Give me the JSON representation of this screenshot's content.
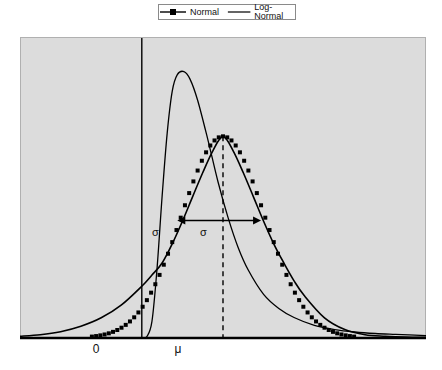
{
  "legend": {
    "position": "top-center",
    "entries": [
      {
        "label": "Normal",
        "marker": "square",
        "style": "line-with-markers",
        "color": "#000000"
      },
      {
        "label": "Log-Normal",
        "marker": "none",
        "style": "line",
        "color": "#000000"
      }
    ]
  },
  "axes": {
    "x_tick_labels": [
      "0",
      "μ"
    ],
    "x_tick_positions": [
      96,
      178
    ],
    "y_tick_labels": [],
    "grid": false,
    "plot_background": "#dcdcdc",
    "axis_color": "#000000"
  },
  "annotations": {
    "sigma_left_label": "σ",
    "sigma_right_label": "σ",
    "zero_line_label": "0",
    "mean_line_label": "μ"
  },
  "chart_data": {
    "type": "line",
    "title": "",
    "xlabel": "",
    "ylabel": "",
    "grid": false,
    "legend_position": "top-center",
    "xlim": [
      -2.4,
      5.6
    ],
    "ylim": [
      0,
      1.0
    ],
    "x_ticks": [
      0,
      1.6
    ],
    "x_tick_labels": [
      "0",
      "μ"
    ],
    "annotations": [
      {
        "text": "σ",
        "type": "arrow-span",
        "from_x": 0.7,
        "to_x": 2.35,
        "y": 0.39,
        "double_headed": true
      },
      {
        "text": "0",
        "type": "vertical-line",
        "x": 0.0
      },
      {
        "text": "μ",
        "type": "dashed-vertical-line",
        "x": 1.6
      }
    ],
    "series": [
      {
        "name": "Normal",
        "style": "line-with-square-markers",
        "color": "#000000",
        "mean": 1.6,
        "sigma": 0.82,
        "peak_value": 0.67,
        "x": [
          -2.4,
          -2.0,
          -1.6,
          -1.2,
          -0.8,
          -0.4,
          0.0,
          0.2,
          0.4,
          0.6,
          0.8,
          1.0,
          1.2,
          1.4,
          1.6,
          1.8,
          2.0,
          2.2,
          2.4,
          2.6,
          2.8,
          3.0,
          3.2,
          3.6,
          4.0,
          4.4,
          4.8,
          5.2,
          5.6
        ],
        "y": [
          0.006,
          0.011,
          0.021,
          0.039,
          0.067,
          0.11,
          0.172,
          0.209,
          0.249,
          0.313,
          0.388,
          0.469,
          0.549,
          0.622,
          0.67,
          0.622,
          0.549,
          0.469,
          0.388,
          0.313,
          0.249,
          0.19,
          0.141,
          0.067,
          0.028,
          0.011,
          0.006,
          0.003,
          0.002
        ]
      },
      {
        "name": "Log-Normal",
        "style": "line",
        "color": "#000000",
        "peak_x": 0.83,
        "peak_value": 0.88,
        "x": [
          0.0,
          0.1,
          0.2,
          0.3,
          0.4,
          0.5,
          0.6,
          0.7,
          0.83,
          0.95,
          1.1,
          1.3,
          1.5,
          1.7,
          1.9,
          2.1,
          2.4,
          2.7,
          3.0,
          3.4,
          3.8,
          4.2,
          4.6,
          5.0,
          5.6
        ],
        "y": [
          0.0,
          0.005,
          0.055,
          0.23,
          0.47,
          0.68,
          0.82,
          0.875,
          0.885,
          0.86,
          0.79,
          0.66,
          0.52,
          0.4,
          0.3,
          0.225,
          0.145,
          0.098,
          0.068,
          0.042,
          0.028,
          0.02,
          0.015,
          0.012,
          0.008
        ]
      }
    ]
  }
}
